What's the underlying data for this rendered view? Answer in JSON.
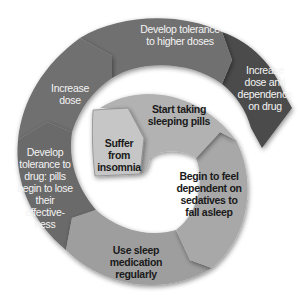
{
  "diagram": {
    "type": "spiral-cycle",
    "title": "",
    "colors": {
      "outer_dark": "#4b4b4b",
      "outer_mid": "#707070",
      "inner_light": "#ababab",
      "center_box": "#c6c6c6",
      "light_text": "#f4f4f4",
      "dark_text": "#1a1a1a"
    },
    "steps": [
      {
        "order": 1,
        "label": "Suffer from insomnia"
      },
      {
        "order": 2,
        "label": "Start taking sleeping pills"
      },
      {
        "order": 3,
        "label": "Begin to feel dependent on sedatives to fall asleep"
      },
      {
        "order": 4,
        "label": "Use sleep medication regularly"
      },
      {
        "order": 5,
        "label": "Develop tolerance to drug: pills begin to lose their effective-ness"
      },
      {
        "order": 6,
        "label": "Increase dose"
      },
      {
        "order": 7,
        "label": "Develop tolerance to higher doses"
      },
      {
        "order": 8,
        "label": "Increase dose and dependence on drug"
      }
    ]
  }
}
